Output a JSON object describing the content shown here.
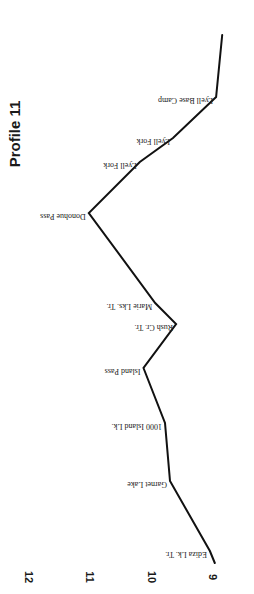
{
  "chart_data": {
    "type": "line",
    "title": "Profile 11",
    "xlabel": "",
    "ylabel": "Elevation (thousands of feet)",
    "orientation": "rotated-90-clockwise",
    "ylim": [
      9,
      12
    ],
    "y_ticks": [
      "9",
      "10",
      "11",
      "12"
    ],
    "grid": false,
    "legend": null,
    "points": [
      {
        "label": "",
        "elevation": 8.97
      },
      {
        "label": "Ediza Lk. Tr.",
        "elevation": 9.05
      },
      {
        "label": "Garnet Lake",
        "elevation": 9.7
      },
      {
        "label": "1000 Island Lk.",
        "elevation": 9.78
      },
      {
        "label": "Island Pass",
        "elevation": 10.13
      },
      {
        "label": "Rush Cr. Tr.",
        "elevation": 9.6
      },
      {
        "label": "Marie Lks. Tr.",
        "elevation": 9.94
      },
      {
        "label": "Donohue Pass",
        "elevation": 11.02
      },
      {
        "label": "Lyell Fork",
        "elevation": 10.19
      },
      {
        "label": "Lyell Fork",
        "elevation": 9.65
      },
      {
        "label": "Lyell Base Camp",
        "elevation": 8.95
      },
      {
        "label": "",
        "elevation": 8.85
      }
    ],
    "categories": [
      "",
      "Ediza Lk. Tr.",
      "Garnet Lake",
      "1000 Island Lk.",
      "Island Pass",
      "Rush Cr. Tr.",
      "Marie Lks. Tr.",
      "Donohue Pass",
      "Lyell Fork",
      "Lyell Fork",
      "Lyell Base Camp",
      ""
    ],
    "values": [
      8.97,
      9.05,
      9.7,
      9.78,
      10.13,
      9.6,
      9.94,
      11.02,
      10.19,
      9.65,
      8.95,
      8.85
    ],
    "series": [
      {
        "name": "Trail elevation",
        "values": [
          8.97,
          9.05,
          9.7,
          9.78,
          10.13,
          9.6,
          9.94,
          11.02,
          10.19,
          9.65,
          8.95,
          8.85
        ]
      }
    ]
  },
  "layout": {
    "px_per_thousand_ft": 61.5,
    "elev9_x": 213,
    "vertex_y": [
      563,
      551,
      481,
      423,
      368,
      324,
      303,
      213,
      162,
      138,
      97,
      35
    ],
    "colors": {
      "line": "#111111",
      "text": "#1a1a1a",
      "background": "#ffffff"
    }
  }
}
